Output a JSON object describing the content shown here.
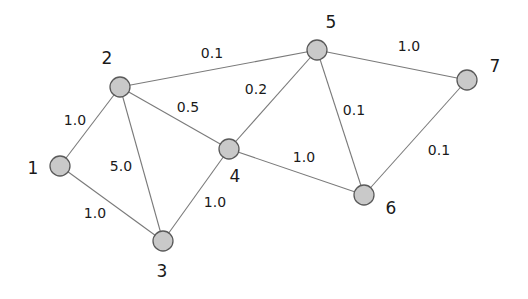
{
  "diagram": {
    "type": "weighted-graph",
    "colors": {
      "node_fill": "#c9c9c9",
      "node_stroke": "#5a5a5a",
      "edge": "#7a7a7a",
      "text": "#1a1a1a"
    },
    "nodes": [
      {
        "id": "1",
        "label": "1",
        "x": 60,
        "y": 166,
        "lx": 33,
        "ly": 168
      },
      {
        "id": "2",
        "label": "2",
        "x": 120,
        "y": 87,
        "lx": 107,
        "ly": 58
      },
      {
        "id": "3",
        "label": "3",
        "x": 163,
        "y": 241,
        "lx": 162,
        "ly": 271
      },
      {
        "id": "4",
        "label": "4",
        "x": 229,
        "y": 149,
        "lx": 235,
        "ly": 176
      },
      {
        "id": "5",
        "label": "5",
        "x": 317,
        "y": 50,
        "lx": 331,
        "ly": 22
      },
      {
        "id": "6",
        "label": "6",
        "x": 364,
        "y": 195,
        "lx": 391,
        "ly": 208
      },
      {
        "id": "7",
        "label": "7",
        "x": 467,
        "y": 80,
        "lx": 495,
        "ly": 66
      }
    ],
    "edges": [
      {
        "from": "1",
        "to": "2",
        "weight": "1.0",
        "lx": 75,
        "ly": 120
      },
      {
        "from": "1",
        "to": "3",
        "weight": "1.0",
        "lx": 95,
        "ly": 213
      },
      {
        "from": "2",
        "to": "3",
        "weight": "5.0",
        "lx": 121,
        "ly": 166
      },
      {
        "from": "2",
        "to": "4",
        "weight": "0.5",
        "lx": 188,
        "ly": 107
      },
      {
        "from": "2",
        "to": "5",
        "weight": "0.1",
        "lx": 212,
        "ly": 53
      },
      {
        "from": "3",
        "to": "4",
        "weight": "1.0",
        "lx": 215,
        "ly": 202
      },
      {
        "from": "4",
        "to": "5",
        "weight": "0.2",
        "lx": 256,
        "ly": 89
      },
      {
        "from": "4",
        "to": "6",
        "weight": "1.0",
        "lx": 304,
        "ly": 157
      },
      {
        "from": "5",
        "to": "6",
        "weight": "0.1",
        "lx": 354,
        "ly": 110
      },
      {
        "from": "5",
        "to": "7",
        "weight": "1.0",
        "lx": 409,
        "ly": 46
      },
      {
        "from": "6",
        "to": "7",
        "weight": "0.1",
        "lx": 439,
        "ly": 150
      }
    ]
  }
}
